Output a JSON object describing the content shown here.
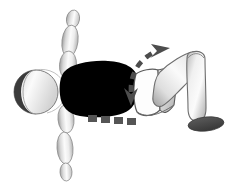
{
  "illustration": {
    "title": "Supine pelvic rotation exercise figure",
    "subject": "stylized human figure lying supine, segmented limb anatomy diagram",
    "view": "lateral-oblique",
    "background_color": "#ffffff",
    "canvas": {
      "width": 238,
      "height": 195
    },
    "palette": {
      "outline": "#333333",
      "body_dark": "#000000",
      "head_dark": "#3a3a3a",
      "limb_light": "#f2f2f2",
      "limb_mid": "#c9c9c9",
      "limb_shadow": "#9a9a9a",
      "foot_dark": "#4a4a4a",
      "arrow_gray": "#4d4d4d",
      "dash_gray": "#555555",
      "pelvis_fill": "#ffffff",
      "pelvis_facet": "#b8b8b8"
    },
    "parts": [
      {
        "name": "head",
        "label": "Head",
        "shape": "shaded sphere",
        "fill": "dark-left-light-right"
      },
      {
        "name": "torso",
        "label": "Torso",
        "shape": "solid black rounded mass"
      },
      {
        "name": "upper-arm-top",
        "label": "Upper arm (raised)",
        "shape": "tapered oval segment"
      },
      {
        "name": "forearm-top",
        "label": "Forearm (raised)",
        "shape": "tapered oval segment"
      },
      {
        "name": "hand-top",
        "label": "Hand (raised)",
        "shape": "small oval"
      },
      {
        "name": "upper-arm-bottom",
        "label": "Upper arm (lowered)",
        "shape": "tapered oval segment"
      },
      {
        "name": "forearm-bottom",
        "label": "Forearm (lowered)",
        "shape": "tapered oval segment"
      },
      {
        "name": "hand-bottom",
        "label": "Hand (lowered)",
        "shape": "small oval"
      },
      {
        "name": "pelvis",
        "label": "Pelvis",
        "shape": "white box with gray facet"
      },
      {
        "name": "thigh",
        "label": "Thigh",
        "shape": "tapered cylinder"
      },
      {
        "name": "shin",
        "label": "Shin",
        "shape": "tapered cylinder"
      },
      {
        "name": "foot",
        "label": "Foot",
        "shape": "dark ellipse"
      }
    ],
    "annotations": [
      {
        "name": "rotation-arrow",
        "label": "Pelvic rotation",
        "type": "curved double-headed dashed arrow",
        "heads": 2,
        "head_directions": [
          "up-right",
          "down"
        ],
        "style": "dashed",
        "color": "#4d4d4d"
      },
      {
        "name": "baseline-dashes",
        "label": "Reference baseline",
        "type": "horizontal dashed line",
        "dash_count": 4,
        "color": "#555555"
      }
    ]
  }
}
